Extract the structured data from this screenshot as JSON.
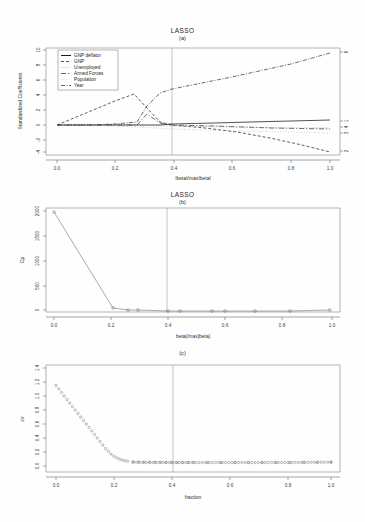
{
  "figure": {
    "panels": [
      {
        "id": "a",
        "title": "LASSO",
        "subtitle": "(a)"
      },
      {
        "id": "b",
        "title": "LASSO",
        "subtitle": "(b)"
      },
      {
        "id": "c",
        "title": "",
        "subtitle": "(c)"
      }
    ]
  },
  "panel_a": {
    "title": "LASSO",
    "subtitle": "(a)",
    "xlabel": "|beta|/max|beta|",
    "ylabel": "Standardized Coefficients",
    "xticks": [
      "0.0",
      "0.2",
      "0.4",
      "0.6",
      "0.8",
      "1.0"
    ],
    "yticks": [
      "-4",
      "-2",
      "0",
      "2",
      "4",
      "6",
      "8",
      "10"
    ],
    "right_ticks": [
      "6",
      "1",
      "4",
      "3",
      "2"
    ],
    "legend": [
      {
        "label": "GNP deflator",
        "dash": "none",
        "color": "#1a1a1a"
      },
      {
        "label": "GNP",
        "dash": "3,2",
        "color": "#2a2a2a"
      },
      {
        "label": "Unemployed",
        "dash": "1,1.6",
        "color": "#8f8f8f"
      },
      {
        "label": "Armed Forces",
        "dash": "5,2,1,2",
        "color": "#3a3a3a"
      },
      {
        "label": "Population",
        "dash": "0.6,2",
        "color": "#9a9a9a"
      },
      {
        "label": "Year",
        "dash": "4,1.5,1,1.5",
        "color": "#3a3a3a"
      }
    ],
    "vline_x": 0.43
  },
  "panel_b": {
    "title": "LASSO",
    "subtitle": "(b)",
    "xlabel": "beta|/max|beta|",
    "ylabel": "Cp",
    "xticks": [
      "0.0",
      "0.2",
      "0.4",
      "0.6",
      "0.8",
      "1.0"
    ],
    "yticks": [
      "0",
      "500",
      "1000",
      "1500",
      "2000"
    ],
    "vline_x": 0.41
  },
  "panel_c": {
    "title": "",
    "subtitle": "(c)",
    "xlabel": "fraction",
    "ylabel": "cv",
    "xticks": [
      "0.0",
      "0.2",
      "0.4",
      "0.6",
      "0.8",
      "1.0"
    ],
    "yticks": [
      "0.0",
      "0.2",
      "0.4",
      "0.6",
      "0.8",
      "1.0",
      "1.2",
      "1.4"
    ],
    "vline_x": 0.435
  },
  "chart_data": [
    {
      "type": "line",
      "panel": "a",
      "title": "LASSO",
      "subtitle": "(a)",
      "xlabel": "|beta|/max|beta|",
      "ylabel": "Standardized Coefficients",
      "xlim": [
        0.0,
        1.0
      ],
      "ylim": [
        -4,
        10
      ],
      "grid": false,
      "legend_position": "top-left",
      "annotations": [
        {
          "type": "vline",
          "x": 0.43
        }
      ],
      "right_axis_labels": [
        "6",
        "1",
        "4",
        "3",
        "2"
      ],
      "series": [
        {
          "name": "GNP deflator",
          "x": [
            0.0,
            0.22,
            0.27,
            0.31,
            0.37,
            0.43,
            0.55,
            0.62,
            0.72,
            0.82,
            0.9,
            1.0
          ],
          "values": [
            0,
            0,
            0,
            0.05,
            0.1,
            0.15,
            0.2,
            0.25,
            0.3,
            0.38,
            0.45,
            0.55
          ]
        },
        {
          "name": "GNP",
          "x": [
            0.0,
            0.1,
            0.2,
            0.26,
            0.31,
            0.37,
            0.43,
            0.55,
            0.66,
            0.78,
            0.9,
            1.0
          ],
          "values": [
            0,
            1.6,
            3.2,
            4.1,
            2.2,
            0.4,
            0.0,
            -0.4,
            -1.0,
            -1.8,
            -2.7,
            -3.6
          ]
        },
        {
          "name": "Unemployed",
          "x": [
            0.0,
            0.2,
            0.4,
            0.6,
            0.8,
            1.0
          ],
          "values": [
            0,
            0,
            -0.15,
            -0.25,
            -0.35,
            -0.45
          ]
        },
        {
          "name": "Armed Forces",
          "x": [
            0.0,
            0.2,
            0.27,
            0.31,
            0.37,
            0.43,
            0.6,
            0.8,
            1.0
          ],
          "values": [
            0,
            0,
            0.0,
            1.4,
            0.3,
            0.05,
            -0.2,
            -0.35,
            -0.5
          ]
        },
        {
          "name": "Population",
          "x": [
            0.0,
            0.2,
            0.4,
            0.6,
            0.8,
            1.0
          ],
          "values": [
            0,
            0,
            -0.5,
            -0.7,
            -0.85,
            -1.0
          ]
        },
        {
          "name": "Year",
          "x": [
            0.0,
            0.1,
            0.2,
            0.27,
            0.31,
            0.37,
            0.43,
            0.6,
            0.8,
            1.0
          ],
          "values": [
            0,
            0,
            0,
            0.3,
            2.6,
            4.2,
            4.7,
            6.2,
            7.9,
            9.6
          ]
        }
      ]
    },
    {
      "type": "line",
      "panel": "b",
      "title": "LASSO",
      "subtitle": "(b)",
      "xlabel": "beta|/max|beta|",
      "ylabel": "Cp",
      "xlim": [
        0.0,
        1.0
      ],
      "ylim": [
        0,
        2050
      ],
      "grid": false,
      "markers": "open-circle",
      "annotations": [
        {
          "type": "vline",
          "x": 0.41
        }
      ],
      "x": [
        0.0,
        0.205,
        0.255,
        0.29,
        0.4,
        0.44,
        0.55,
        0.59,
        0.72,
        0.86,
        1.0
      ],
      "values": [
        1980,
        85,
        55,
        50,
        40,
        40,
        38,
        36,
        34,
        34,
        45
      ]
    },
    {
      "type": "line",
      "panel": "c",
      "title": "",
      "subtitle": "(c)",
      "xlabel": "fraction",
      "ylabel": "cv",
      "xlim": [
        0.0,
        1.0
      ],
      "ylim": [
        0.0,
        1.45
      ],
      "grid": false,
      "markers": "open-circle",
      "annotations": [
        {
          "type": "vline",
          "x": 0.435
        }
      ],
      "x": [
        0.0,
        0.01,
        0.02,
        0.03,
        0.04,
        0.05,
        0.06,
        0.07,
        0.08,
        0.09,
        0.1,
        0.11,
        0.12,
        0.13,
        0.14,
        0.15,
        0.16,
        0.17,
        0.18,
        0.19,
        0.2,
        0.21,
        0.22,
        0.23,
        0.24,
        0.25,
        0.26,
        0.28,
        0.3,
        0.32,
        0.34,
        0.36,
        0.38,
        0.4,
        0.42,
        0.44,
        0.46,
        0.48,
        0.5,
        0.55,
        0.6,
        0.65,
        0.7,
        0.75,
        0.8,
        0.85,
        0.9,
        0.95,
        1.0
      ],
      "values": [
        1.15,
        1.1,
        1.05,
        1.0,
        0.95,
        0.9,
        0.85,
        0.8,
        0.75,
        0.7,
        0.65,
        0.6,
        0.55,
        0.5,
        0.45,
        0.4,
        0.35,
        0.3,
        0.25,
        0.21,
        0.17,
        0.14,
        0.12,
        0.1,
        0.085,
        0.075,
        0.068,
        0.062,
        0.058,
        0.056,
        0.055,
        0.054,
        0.053,
        0.052,
        0.052,
        0.051,
        0.051,
        0.05,
        0.05,
        0.05,
        0.05,
        0.05,
        0.05,
        0.05,
        0.05,
        0.05,
        0.051,
        0.052,
        0.055
      ]
    }
  ]
}
